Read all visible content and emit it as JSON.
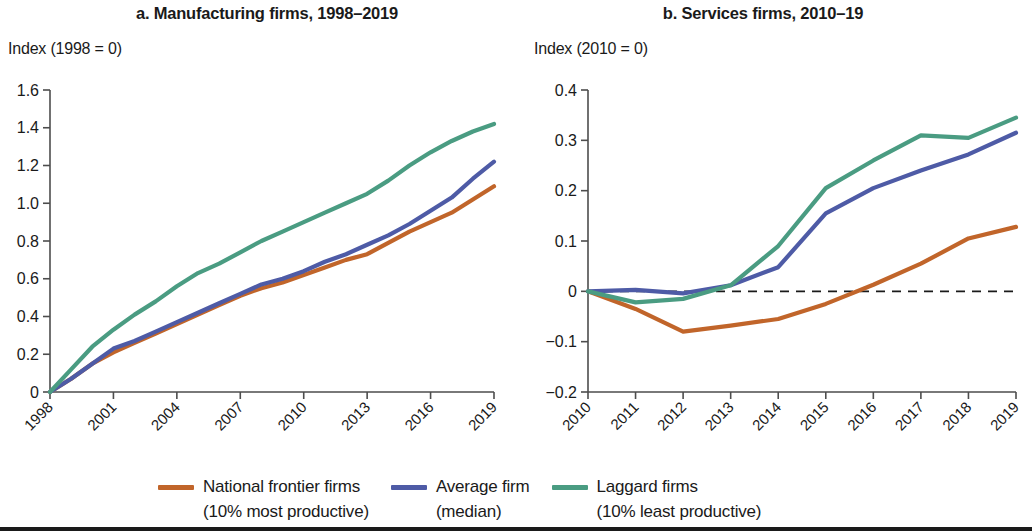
{
  "figure": {
    "panels": [
      {
        "key": "a",
        "title": "a. Manufacturing firms, 1998–2019",
        "axis_caption": "Index (1998 = 0)"
      },
      {
        "key": "b",
        "title": "b. Services firms, 2010–19",
        "axis_caption": "Index (2010 = 0)"
      }
    ]
  },
  "legend": {
    "position": "bottom",
    "items": [
      {
        "label": "National frontier firms",
        "sublabel": "(10% most productive)",
        "color": "#c1652a",
        "series_key": "national_frontier_firms"
      },
      {
        "label": "Average firm",
        "sublabel": "(median)",
        "color": "#4e5ba6",
        "series_key": "average_firm"
      },
      {
        "label": "Laggard firms",
        "sublabel": "(10% least productive)",
        "color": "#4a9c82",
        "series_key": "laggard_firms"
      }
    ]
  },
  "chart_data": [
    {
      "type": "line",
      "panel": "a",
      "title": "a. Manufacturing firms, 1998–2019",
      "xlabel": "",
      "ylabel": "Index (1998 = 0)",
      "ylim": [
        0,
        1.6
      ],
      "ytick_labels": [
        "1.6",
        "1.4",
        "1.2",
        "1.0",
        "0.8",
        "0.6",
        "0.4",
        "0.2",
        "0"
      ],
      "yticks": [
        1.6,
        1.4,
        1.2,
        1.0,
        0.8,
        0.6,
        0.4,
        0.2,
        0
      ],
      "grid": false,
      "zero_line": false,
      "xlim": [
        1998,
        2019
      ],
      "x": [
        1998,
        1999,
        2000,
        2001,
        2002,
        2003,
        2004,
        2005,
        2006,
        2007,
        2008,
        2009,
        2010,
        2011,
        2012,
        2013,
        2014,
        2015,
        2016,
        2017,
        2018,
        2019
      ],
      "xtick_labels": [
        "1998",
        "2001",
        "2004",
        "2007",
        "2010",
        "2013",
        "2016",
        "2019"
      ],
      "xticks": [
        1998,
        2001,
        2004,
        2007,
        2010,
        2013,
        2016,
        2019
      ],
      "series": [
        {
          "name": "National frontier firms",
          "key": "national_frontier_firms",
          "color": "#c1652a",
          "values": [
            0,
            0.07,
            0.15,
            0.21,
            0.26,
            0.31,
            0.36,
            0.41,
            0.46,
            0.51,
            0.55,
            0.58,
            0.62,
            0.66,
            0.7,
            0.73,
            0.79,
            0.85,
            0.9,
            0.95,
            1.02,
            1.09
          ]
        },
        {
          "name": "Average firm",
          "key": "average_firm",
          "color": "#4e5ba6",
          "values": [
            0,
            0.07,
            0.15,
            0.23,
            0.27,
            0.32,
            0.37,
            0.42,
            0.47,
            0.52,
            0.57,
            0.6,
            0.64,
            0.69,
            0.73,
            0.78,
            0.83,
            0.89,
            0.96,
            1.03,
            1.13,
            1.22
          ]
        },
        {
          "name": "Laggard firms",
          "key": "laggard_firms",
          "color": "#4a9c82",
          "values": [
            0,
            0.12,
            0.24,
            0.33,
            0.41,
            0.48,
            0.56,
            0.63,
            0.68,
            0.74,
            0.8,
            0.85,
            0.9,
            0.95,
            1.0,
            1.05,
            1.12,
            1.2,
            1.27,
            1.33,
            1.38,
            1.42
          ]
        }
      ]
    },
    {
      "type": "line",
      "panel": "b",
      "title": "b. Services firms, 2010–19",
      "xlabel": "",
      "ylabel": "Index (2010 = 0)",
      "ylim": [
        -0.2,
        0.4
      ],
      "ytick_labels": [
        "0.4",
        "0.3",
        "0.2",
        "0.1",
        "0",
        "−0.1",
        "−0.2"
      ],
      "yticks": [
        0.4,
        0.3,
        0.2,
        0.1,
        0,
        -0.1,
        -0.2
      ],
      "grid": false,
      "zero_line": true,
      "xlim": [
        2010,
        2019
      ],
      "x": [
        2010,
        2011,
        2012,
        2013,
        2014,
        2015,
        2016,
        2017,
        2018,
        2019
      ],
      "xtick_labels": [
        "2010",
        "2011",
        "2012",
        "2013",
        "2014",
        "2015",
        "2016",
        "2017",
        "2018",
        "2019"
      ],
      "xticks": [
        2010,
        2011,
        2012,
        2013,
        2014,
        2015,
        2016,
        2017,
        2018,
        2019
      ],
      "series": [
        {
          "name": "National frontier firms",
          "key": "national_frontier_firms",
          "color": "#c1652a",
          "values": [
            0,
            -0.035,
            -0.08,
            -0.068,
            -0.055,
            -0.025,
            0.013,
            0.055,
            0.105,
            0.128
          ]
        },
        {
          "name": "Average firm",
          "key": "average_firm",
          "color": "#4e5ba6",
          "values": [
            0,
            0.003,
            -0.004,
            0.012,
            0.048,
            0.155,
            0.205,
            0.24,
            0.272,
            0.315
          ]
        },
        {
          "name": "Laggard firms",
          "key": "laggard_firms",
          "color": "#4a9c82",
          "values": [
            0,
            -0.022,
            -0.015,
            0.012,
            0.09,
            0.205,
            0.26,
            0.31,
            0.305,
            0.345
          ]
        }
      ]
    }
  ]
}
